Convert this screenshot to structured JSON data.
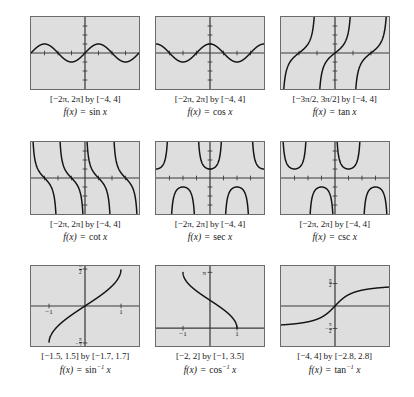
{
  "figure": {
    "colors": {
      "plot_background": "#dedede",
      "plot_border": "#6b6b6b",
      "axis": "#3a3a3a",
      "curve": "#141414",
      "page_background": "#ffffff"
    },
    "rows": 3,
    "columns": 3
  },
  "panels": [
    {
      "id": "sin",
      "range_label": "[−2π, 2π] by [−4, 4]",
      "function_label": "f(x) = sin x",
      "fn_name": "sin",
      "fn_arg": "x",
      "fn_exp": "",
      "xlim": [
        -6.283185307,
        6.283185307
      ],
      "ylim": [
        -4,
        4
      ],
      "xticks": [
        -4.71238898,
        -3.141592654,
        -1.570796327,
        1.570796327,
        3.141592654,
        4.71238898
      ],
      "yticks": [
        -3,
        -2,
        -1,
        1,
        2,
        3
      ],
      "axis_labels": []
    },
    {
      "id": "cos",
      "range_label": "[−2π, 2π] by [−4, 4]",
      "function_label": "f(x) = cos x",
      "fn_name": "cos",
      "fn_arg": "x",
      "fn_exp": "",
      "xlim": [
        -6.283185307,
        6.283185307
      ],
      "ylim": [
        -4,
        4
      ],
      "xticks": [
        -4.71238898,
        -3.141592654,
        -1.570796327,
        1.570796327,
        3.141592654,
        4.71238898
      ],
      "yticks": [
        -3,
        -2,
        -1,
        1,
        2,
        3
      ],
      "axis_labels": []
    },
    {
      "id": "tan",
      "range_label": "[−3π/2, 3π/2] by [−4, 4]",
      "function_label": "f(x) = tan x",
      "fn_name": "tan",
      "fn_arg": "x",
      "fn_exp": "",
      "xlim": [
        -4.71238898,
        4.71238898
      ],
      "ylim": [
        -4,
        4
      ],
      "xticks": [
        -3.141592654,
        -1.570796327,
        1.570796327,
        3.141592654
      ],
      "yticks": [
        -3,
        -2,
        -1,
        1,
        2,
        3
      ],
      "axis_labels": []
    },
    {
      "id": "cot",
      "range_label": "[−2π, 2π] by [−4, 4]",
      "function_label": "f(x) = cot x",
      "fn_name": "cot",
      "fn_arg": "x",
      "fn_exp": "",
      "xlim": [
        -6.283185307,
        6.283185307
      ],
      "ylim": [
        -4,
        4
      ],
      "xticks": [
        -4.71238898,
        -3.141592654,
        -1.570796327,
        1.570796327,
        3.141592654,
        4.71238898
      ],
      "yticks": [
        -3,
        -2,
        -1,
        1,
        2,
        3
      ],
      "axis_labels": []
    },
    {
      "id": "sec",
      "range_label": "[−2π, 2π] by [−4, 4]",
      "function_label": "f(x) = sec x",
      "fn_name": "sec",
      "fn_arg": "x",
      "fn_exp": "",
      "xlim": [
        -6.283185307,
        6.283185307
      ],
      "ylim": [
        -4,
        4
      ],
      "xticks": [
        -4.71238898,
        -3.141592654,
        -1.570796327,
        1.570796327,
        3.141592654,
        4.71238898
      ],
      "yticks": [
        -3,
        -2,
        -1,
        1,
        2,
        3
      ],
      "axis_labels": []
    },
    {
      "id": "csc",
      "range_label": "[−2π, 2π] by [−4, 4]",
      "function_label": "f(x) = csc x",
      "fn_name": "csc",
      "fn_arg": "x",
      "fn_exp": "",
      "xlim": [
        -6.283185307,
        6.283185307
      ],
      "ylim": [
        -4,
        4
      ],
      "xticks": [
        -4.71238898,
        -3.141592654,
        -1.570796327,
        1.570796327,
        3.141592654,
        4.71238898
      ],
      "yticks": [
        -3,
        -2,
        -1,
        1,
        2,
        3
      ],
      "axis_labels": []
    },
    {
      "id": "arcsin",
      "range_label": "[−1.5, 1.5] by [−1.7, 1.7]",
      "function_label": "f(x) = sin⁻¹ x",
      "fn_name": "sin",
      "fn_arg": "x",
      "fn_exp": "−1",
      "xlim": [
        -1.5,
        1.5
      ],
      "ylim": [
        -1.7,
        1.7
      ],
      "xticks": [
        -1,
        1
      ],
      "yticks": [
        -1.570796327,
        1.570796327
      ],
      "axis_labels": [
        {
          "text": "−1",
          "axis": "x",
          "value": -1
        },
        {
          "text": "1",
          "axis": "x",
          "value": 1
        },
        {
          "text": "π/2",
          "axis": "y",
          "value": 1.570796327
        },
        {
          "text": "−π/2",
          "axis": "y",
          "value": -1.570796327
        }
      ]
    },
    {
      "id": "arccos",
      "range_label": "[−2, 2] by [−1, 3.5]",
      "function_label": "f(x) = cos⁻¹ x",
      "fn_name": "cos",
      "fn_arg": "x",
      "fn_exp": "−1",
      "xlim": [
        -2,
        2
      ],
      "ylim": [
        -1,
        3.5
      ],
      "xticks": [
        -1,
        1
      ],
      "yticks": [
        3.141592654
      ],
      "axis_labels": [
        {
          "text": "−1",
          "axis": "x",
          "value": -1
        },
        {
          "text": "1",
          "axis": "x",
          "value": 1
        },
        {
          "text": "π",
          "axis": "y",
          "value": 3.141592654
        }
      ]
    },
    {
      "id": "arctan",
      "range_label": "[−4, 4] by [−2.8, 2.8]",
      "function_label": "f(x) = tan⁻¹ x",
      "fn_name": "tan",
      "fn_arg": "x",
      "fn_exp": "−1",
      "xlim": [
        -4,
        4
      ],
      "ylim": [
        -2.8,
        2.8
      ],
      "xticks": [],
      "yticks": [
        -1.570796327,
        1.570796327
      ],
      "axis_labels": [
        {
          "text": "π/2",
          "axis": "y",
          "value": 1.570796327
        },
        {
          "text": "−π/2",
          "axis": "y",
          "value": -1.570796327
        }
      ]
    }
  ],
  "chart_data": {
    "type": "line",
    "layout": "3x3 grid of function plots",
    "grid": false,
    "legend": "none",
    "xlabel": "",
    "ylabel": "",
    "charts": [
      {
        "id": "sin",
        "type": "line",
        "title": "f(x) = sin x",
        "expression": "sin(x)",
        "xlim": [
          -6.283185307,
          6.283185307
        ],
        "ylim": [
          -4,
          4
        ],
        "range_label": "[−2π, 2π] by [−4, 4]",
        "asymptotes": [],
        "key_points": [
          {
            "x": -6.2832,
            "y": 0
          },
          {
            "x": -4.7124,
            "y": -1
          },
          {
            "x": -3.1416,
            "y": 0
          },
          {
            "x": -1.5708,
            "y": 1
          },
          {
            "x": 0,
            "y": 0
          },
          {
            "x": 1.5708,
            "y": 1
          },
          {
            "x": 3.1416,
            "y": 0
          },
          {
            "x": 4.7124,
            "y": -1
          },
          {
            "x": 6.2832,
            "y": 0
          }
        ]
      },
      {
        "id": "cos",
        "type": "line",
        "title": "f(x) = cos x",
        "expression": "cos(x)",
        "xlim": [
          -6.283185307,
          6.283185307
        ],
        "ylim": [
          -4,
          4
        ],
        "range_label": "[−2π, 2π] by [−4, 4]",
        "asymptotes": [],
        "key_points": [
          {
            "x": -6.2832,
            "y": 1
          },
          {
            "x": -4.7124,
            "y": 0
          },
          {
            "x": -3.1416,
            "y": -1
          },
          {
            "x": -1.5708,
            "y": 0
          },
          {
            "x": 0,
            "y": 1
          },
          {
            "x": 1.5708,
            "y": 0
          },
          {
            "x": 3.1416,
            "y": -1
          },
          {
            "x": 4.7124,
            "y": 0
          },
          {
            "x": 6.2832,
            "y": 1
          }
        ]
      },
      {
        "id": "tan",
        "type": "line",
        "title": "f(x) = tan x",
        "expression": "tan(x)",
        "xlim": [
          -4.71238898,
          4.71238898
        ],
        "ylim": [
          -4,
          4
        ],
        "range_label": "[−3π/2, 3π/2] by [−4, 4]",
        "asymptotes": [
          -4.71238898,
          -1.570796327,
          1.570796327,
          4.71238898
        ],
        "key_points": [
          {
            "x": -3.1416,
            "y": 0
          },
          {
            "x": 0,
            "y": 0
          },
          {
            "x": 3.1416,
            "y": 0
          }
        ]
      },
      {
        "id": "cot",
        "type": "line",
        "title": "f(x) = cot x",
        "expression": "cot(x)",
        "xlim": [
          -6.283185307,
          6.283185307
        ],
        "ylim": [
          -4,
          4
        ],
        "range_label": "[−2π, 2π] by [−4, 4]",
        "asymptotes": [
          -6.283185307,
          -3.141592654,
          0,
          3.141592654,
          6.283185307
        ],
        "key_points": [
          {
            "x": -4.7124,
            "y": 0
          },
          {
            "x": -1.5708,
            "y": 0
          },
          {
            "x": 1.5708,
            "y": 0
          },
          {
            "x": 4.7124,
            "y": 0
          }
        ]
      },
      {
        "id": "sec",
        "type": "line",
        "title": "f(x) = sec x",
        "expression": "sec(x)",
        "xlim": [
          -6.283185307,
          6.283185307
        ],
        "ylim": [
          -4,
          4
        ],
        "range_label": "[−2π, 2π] by [−4, 4]",
        "asymptotes": [
          -4.71238898,
          -1.570796327,
          1.570796327,
          4.71238898
        ],
        "key_points": [
          {
            "x": -6.2832,
            "y": 1
          },
          {
            "x": -3.1416,
            "y": -1
          },
          {
            "x": 0,
            "y": 1
          },
          {
            "x": 3.1416,
            "y": -1
          },
          {
            "x": 6.2832,
            "y": 1
          }
        ]
      },
      {
        "id": "csc",
        "type": "line",
        "title": "f(x) = csc x",
        "expression": "csc(x)",
        "xlim": [
          -6.283185307,
          6.283185307
        ],
        "ylim": [
          -4,
          4
        ],
        "range_label": "[−2π, 2π] by [−4, 4]",
        "asymptotes": [
          -6.283185307,
          -3.141592654,
          0,
          3.141592654,
          6.283185307
        ],
        "key_points": [
          {
            "x": -4.7124,
            "y": -1
          },
          {
            "x": -1.5708,
            "y": -1
          },
          {
            "x": 1.5708,
            "y": 1
          },
          {
            "x": 4.7124,
            "y": 1
          }
        ]
      },
      {
        "id": "arcsin",
        "type": "line",
        "title": "f(x) = sin⁻¹ x",
        "expression": "arcsin(x)",
        "xlim": [
          -1.5,
          1.5
        ],
        "ylim": [
          -1.7,
          1.7
        ],
        "range_label": "[−1.5, 1.5] by [−1.7, 1.7]",
        "asymptotes": [],
        "key_points": [
          {
            "x": -1,
            "y": -1.5708
          },
          {
            "x": 0,
            "y": 0
          },
          {
            "x": 1,
            "y": 1.5708
          }
        ]
      },
      {
        "id": "arccos",
        "type": "line",
        "title": "f(x) = cos⁻¹ x",
        "expression": "arccos(x)",
        "xlim": [
          -2,
          2
        ],
        "ylim": [
          -1,
          3.5
        ],
        "range_label": "[−2, 2] by [−1, 3.5]",
        "asymptotes": [],
        "key_points": [
          {
            "x": -1,
            "y": 3.1416
          },
          {
            "x": 0,
            "y": 1.5708
          },
          {
            "x": 1,
            "y": 0
          }
        ]
      },
      {
        "id": "arctan",
        "type": "line",
        "title": "f(x) = tan⁻¹ x",
        "expression": "arctan(x)",
        "xlim": [
          -4,
          4
        ],
        "ylim": [
          -2.8,
          2.8
        ],
        "range_label": "[−4, 4] by [−2.8, 2.8]",
        "asymptotes": [
          -1.570796327,
          1.570796327
        ],
        "key_points": [
          {
            "x": -4,
            "y": -1.3258
          },
          {
            "x": 0,
            "y": 0
          },
          {
            "x": 4,
            "y": 1.3258
          }
        ]
      }
    ]
  }
}
